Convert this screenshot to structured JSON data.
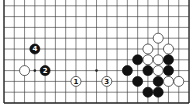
{
  "diagram": {
    "type": "go-board-fragment",
    "board_size": 19,
    "visible_rows_from_bottom": 10,
    "colors": {
      "background": "#ffffff",
      "line": "#333333",
      "edge": "#222222",
      "black_stone": "#111111",
      "white_stone": "#ffffff",
      "white_stone_outline": "#222222",
      "label_on_black": "#ffffff",
      "label_on_white": "#111111"
    },
    "grid": {
      "x0": 4,
      "dx": 10.28,
      "y_bottom": 103,
      "dy": 10.8
    },
    "star_points": [
      {
        "col": 3,
        "row": 3
      },
      {
        "col": 9,
        "row": 3
      }
    ],
    "stones": [
      {
        "color": "white",
        "col": 2,
        "row": 3,
        "label": ""
      },
      {
        "color": "black",
        "col": 4,
        "row": 3,
        "label": "2"
      },
      {
        "color": "black",
        "col": 3,
        "row": 5,
        "label": "4"
      },
      {
        "color": "white",
        "col": 7,
        "row": 2,
        "label": "1"
      },
      {
        "color": "white",
        "col": 10,
        "row": 2,
        "label": "3"
      },
      {
        "color": "white",
        "col": 15,
        "row": 6,
        "label": ""
      },
      {
        "color": "white",
        "col": 14,
        "row": 5,
        "label": ""
      },
      {
        "color": "white",
        "col": 16,
        "row": 5,
        "label": ""
      },
      {
        "color": "black",
        "col": 13,
        "row": 4,
        "label": ""
      },
      {
        "color": "white",
        "col": 14,
        "row": 4,
        "label": ""
      },
      {
        "color": "white",
        "col": 15,
        "row": 4,
        "label": ""
      },
      {
        "color": "black",
        "col": 16,
        "row": 4,
        "label": ""
      },
      {
        "color": "black",
        "col": 12,
        "row": 3,
        "label": ""
      },
      {
        "color": "black",
        "col": 14,
        "row": 3,
        "label": ""
      },
      {
        "color": "white",
        "col": 15,
        "row": 3,
        "label": ""
      },
      {
        "color": "black",
        "col": 16,
        "row": 3,
        "label": ""
      },
      {
        "color": "black",
        "col": 13,
        "row": 2,
        "label": ""
      },
      {
        "color": "black",
        "col": 15,
        "row": 2,
        "label": ""
      },
      {
        "color": "white",
        "col": 16,
        "row": 2,
        "label": ""
      },
      {
        "color": "white",
        "col": 17,
        "row": 2,
        "label": ""
      },
      {
        "color": "black",
        "col": 14,
        "row": 1,
        "label": ""
      },
      {
        "color": "black",
        "col": 15,
        "row": 1,
        "label": ""
      }
    ]
  }
}
